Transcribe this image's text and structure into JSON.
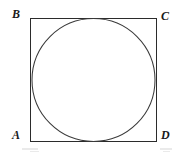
{
  "figure": {
    "background_color": "#ffffff",
    "stroke_color": "#2b2b2b",
    "stroke_width": 1,
    "canvas": {
      "width": 176,
      "height": 155
    },
    "square": {
      "name": "ABCD",
      "x": 30,
      "y": 18,
      "width": 126,
      "height": 123,
      "fill": "none"
    },
    "circle": {
      "name": "inscribed circle",
      "cx": 93,
      "cy": 80,
      "r": 62,
      "fill": "none"
    },
    "labels": {
      "a": "A",
      "b": "B",
      "c": "C",
      "d": "D"
    },
    "label_positions": {
      "a": "bottom-left",
      "b": "top-left",
      "c": "top-right",
      "d": "bottom-right"
    }
  }
}
